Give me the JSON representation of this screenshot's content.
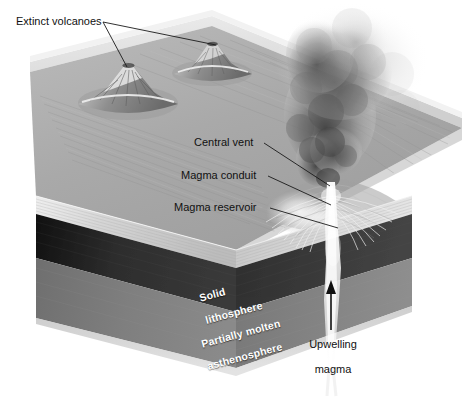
{
  "figure": {
    "background_color": "#ffffff"
  },
  "labels": {
    "extinct_volcanoes": "Extinct volcanoes",
    "central_vent": "Central vent",
    "magma_conduit": "Magma conduit",
    "magma_reservoir": "Magma reservoir",
    "solid_lithosphere_line1": "Solid",
    "solid_lithosphere_line2": "lithosphere",
    "asthenosphere_line1": "Partially molten",
    "asthenosphere_line2": "asthenosphere",
    "upwelling_line1": "Upwelling",
    "upwelling_line2": "magma"
  },
  "colors": {
    "label_dark": "#111111",
    "label_white": "#ffffff",
    "leader_line": "#1a1a1a",
    "crust_top_light": "#d8d8d8",
    "crust_top_mid": "#bdbdbd",
    "crust_face": "#c9c9c9",
    "lithosphere_dark": "#2b2b2b",
    "asthenosphere_gray": "#7d7d7d",
    "magma_bright": "#f2f2f2",
    "plume_dark": "#6e6e6e"
  },
  "features": {
    "extinct_volcano_left": "extinct volcano cone, left",
    "extinct_volcano_right": "extinct volcano cone, right",
    "active_volcano": "erupting volcano with ash plume",
    "ash_plume": "dark billowing eruption column",
    "magma_reservoir_body": "bright magma reservoir beneath volcano",
    "magma_conduit_body": "vertical magma conduit",
    "upwelling_magma_column": "mantle upwelling column",
    "upwelling_arrow": "upward arrow marking rising magma"
  }
}
